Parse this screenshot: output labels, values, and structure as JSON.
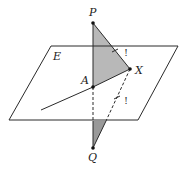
{
  "diagram": {
    "plane_label": "E",
    "points": {
      "P": {
        "label": "P"
      },
      "A": {
        "label": "A"
      },
      "X": {
        "label": "X"
      },
      "Q": {
        "label": "Q"
      }
    },
    "marks": {
      "upper_tick": "!",
      "lower_tick": "!"
    },
    "colors": {
      "stroke": "#2a2a2a",
      "shade_upper": "#b8b8b8",
      "shade_lower": "#999999"
    }
  }
}
